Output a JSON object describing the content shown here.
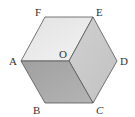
{
  "figure": {
    "type": "regular hexagon divided into three rhombi (cube illusion)",
    "vertices": {
      "A": {
        "label": "A",
        "x": 21,
        "y": 61
      },
      "B": {
        "label": "B",
        "x": 45,
        "y": 103
      },
      "C": {
        "label": "C",
        "x": 93,
        "y": 103
      },
      "D": {
        "label": "D",
        "x": 117,
        "y": 61
      },
      "E": {
        "label": "E",
        "x": 93,
        "y": 17
      },
      "F": {
        "label": "F",
        "x": 45,
        "y": 17
      },
      "O": {
        "label": "O",
        "x": 69,
        "y": 61
      }
    },
    "faces": [
      {
        "name": "top-rhombus",
        "points": "AFEO",
        "color": "#ebebeb"
      },
      {
        "name": "right-rhombus",
        "points": "OEDC",
        "color": "#c8c8c8"
      },
      {
        "name": "bottom-rhombus",
        "points": "AOCB",
        "color": "#a9a9a9"
      }
    ],
    "stroke_color": "#555555"
  }
}
